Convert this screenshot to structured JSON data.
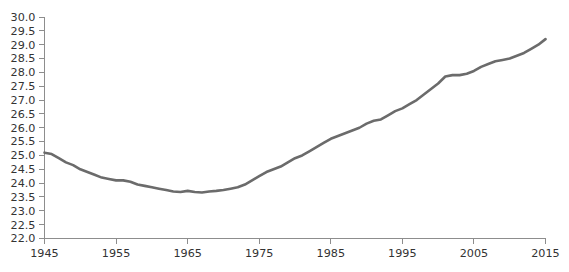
{
  "chart_data": {
    "type": "line",
    "title": "",
    "subtitle": "",
    "xlabel": "",
    "ylabel": "",
    "xlim": [
      1945,
      2015
    ],
    "ylim": [
      22.0,
      30.0
    ],
    "grid": false,
    "legend": null,
    "legend_position": "none",
    "line_color": "#6b6b6b",
    "line_width": 2.6,
    "axis_color": "#8d8d8d",
    "tick_label_color": "#333333",
    "background_color": "#ffffff",
    "xticks": [
      1945,
      1955,
      1965,
      1975,
      1985,
      1995,
      2005,
      2015
    ],
    "xtick_labels": [
      "1945",
      "1955",
      "1965",
      "1975",
      "1985",
      "1995",
      "2005",
      "2015"
    ],
    "yticks": [
      22.0,
      22.5,
      23.0,
      23.5,
      24.0,
      24.5,
      25.0,
      25.5,
      26.0,
      26.5,
      27.0,
      27.5,
      28.0,
      28.5,
      29.0,
      29.5,
      30.0
    ],
    "ytick_labels": [
      "22.0",
      "22.5",
      "23.0",
      "23.5",
      "24.0",
      "24.5",
      "25.0",
      "25.5",
      "26.0",
      "26.5",
      "27.0",
      "27.5",
      "28.0",
      "28.5",
      "29.0",
      "29.5",
      "30.0"
    ],
    "x": [
      1945,
      1946,
      1947,
      1948,
      1949,
      1950,
      1951,
      1952,
      1953,
      1954,
      1955,
      1956,
      1957,
      1958,
      1959,
      1960,
      1961,
      1962,
      1963,
      1964,
      1965,
      1966,
      1967,
      1968,
      1969,
      1970,
      1971,
      1972,
      1973,
      1974,
      1975,
      1976,
      1977,
      1978,
      1979,
      1980,
      1981,
      1982,
      1983,
      1984,
      1985,
      1986,
      1987,
      1988,
      1989,
      1990,
      1991,
      1992,
      1993,
      1994,
      1995,
      1996,
      1997,
      1998,
      1999,
      2000,
      2001,
      2002,
      2003,
      2004,
      2005,
      2006,
      2007,
      2008,
      2009,
      2010,
      2011,
      2012,
      2013,
      2014,
      2015
    ],
    "values": [
      25.1,
      25.05,
      24.9,
      24.75,
      24.65,
      24.5,
      24.4,
      24.3,
      24.2,
      24.15,
      24.1,
      24.1,
      24.05,
      23.95,
      23.9,
      23.85,
      23.8,
      23.75,
      23.7,
      23.68,
      23.72,
      23.68,
      23.66,
      23.7,
      23.72,
      23.75,
      23.8,
      23.85,
      23.95,
      24.1,
      24.25,
      24.4,
      24.5,
      24.6,
      24.75,
      24.9,
      25.0,
      25.15,
      25.3,
      25.45,
      25.6,
      25.7,
      25.8,
      25.9,
      26.0,
      26.15,
      26.25,
      26.3,
      26.45,
      26.6,
      26.7,
      26.85,
      27.0,
      27.2,
      27.4,
      27.6,
      27.85,
      27.9,
      27.9,
      27.95,
      28.05,
      28.2,
      28.3,
      28.4,
      28.45,
      28.5,
      28.6,
      28.7,
      28.85,
      29.0,
      29.2
    ]
  }
}
